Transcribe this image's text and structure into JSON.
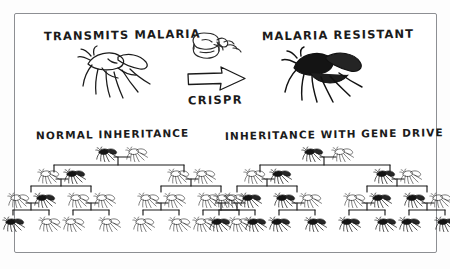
{
  "figure": {
    "title_left": "TRANSMITS MALARIA",
    "title_right": "MALARIA RESISTANT",
    "transform_label": "CRISPR",
    "section_left": "NORMAL INHERITANCE",
    "section_right": "INHERITANCE WITH GENE DRIVE",
    "ink_color": "#1b1b1b",
    "frame_color": "#8d8f93",
    "background_color": "#ffffff"
  },
  "icons": {
    "mosquito_light": "mosquito-outline-icon",
    "mosquito_dark": "mosquito-filled-icon",
    "arrow": "right-arrow-icon",
    "crispr": "cas9-protein-icon"
  },
  "legend": {
    "light_meaning": "TRANSMITS MALARIA",
    "dark_meaning": "MALARIA RESISTANT"
  },
  "chart_data": {
    "type": "diagram",
    "trees": [
      {
        "name": "NORMAL INHERITANCE",
        "generations": [
          {
            "gen": 1,
            "count": 2,
            "states": [
              "dark",
              "light"
            ]
          },
          {
            "gen": 2,
            "count": 4,
            "states": [
              "light",
              "dark",
              "light",
              "light"
            ]
          },
          {
            "gen": 3,
            "count": 8,
            "states": [
              "light",
              "dark",
              "light",
              "light",
              "light",
              "light",
              "light",
              "light"
            ]
          },
          {
            "gen": 4,
            "count": 8,
            "states": [
              "dark",
              "light",
              "light",
              "light",
              "light",
              "light",
              "light",
              "light"
            ]
          }
        ],
        "dark_counts": [
          1,
          1,
          1,
          1
        ],
        "dark_fraction": [
          0.5,
          0.25,
          0.125,
          0.125
        ]
      },
      {
        "name": "INHERITANCE WITH GENE DRIVE",
        "generations": [
          {
            "gen": 1,
            "count": 2,
            "states": [
              "dark",
              "light"
            ]
          },
          {
            "gen": 2,
            "count": 4,
            "states": [
              "light",
              "dark",
              "dark",
              "light"
            ]
          },
          {
            "gen": 3,
            "count": 8,
            "states": [
              "light",
              "dark",
              "dark",
              "light",
              "light",
              "dark",
              "dark",
              "light"
            ]
          },
          {
            "gen": 4,
            "count": 8,
            "states": [
              "dark",
              "dark",
              "dark",
              "dark",
              "dark",
              "dark",
              "dark",
              "dark"
            ]
          }
        ],
        "dark_counts": [
          1,
          2,
          4,
          8
        ],
        "dark_fraction": [
          0.5,
          0.5,
          0.5,
          1.0
        ]
      }
    ]
  }
}
